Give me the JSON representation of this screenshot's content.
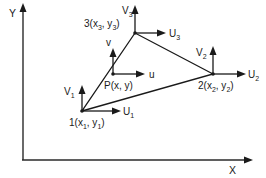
{
  "diagram": {
    "axes": {
      "x_label": "X",
      "y_label": "Y"
    },
    "nodes": [
      {
        "id": "1",
        "label_prefix": "1(x",
        "sub_x": "1",
        "mid": ", y",
        "sub_y": "1",
        "suffix": ")",
        "u_label": "U",
        "u_sub": "1",
        "v_label": "V",
        "v_sub": "1"
      },
      {
        "id": "2",
        "label_prefix": "2(x",
        "sub_x": "2",
        "mid": ", y",
        "sub_y": "2",
        "suffix": ")",
        "u_label": "U",
        "u_sub": "2",
        "v_label": "V",
        "v_sub": "2"
      },
      {
        "id": "3",
        "label_prefix": "3(x",
        "sub_x": "3",
        "mid": ", y",
        "sub_y": "3",
        "suffix": ")",
        "u_label": "U",
        "u_sub": "3",
        "v_label": "V",
        "v_sub": "3"
      }
    ],
    "interior_point": {
      "label": "P(x, y)",
      "u_label": "u",
      "v_label": "v"
    },
    "colors": {
      "stroke": "#1a1a1a",
      "background": "#ffffff"
    }
  }
}
